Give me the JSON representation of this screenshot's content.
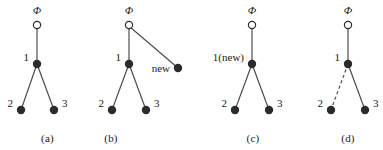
{
  "figure": {
    "background_color": "#ffffff",
    "ink_color": "#1a1a1a",
    "edge_color": "#4d4d4d",
    "filled_node_color": "#2b2b2b",
    "open_node_fill": "#ffffff",
    "root_symbol": "Φ",
    "panels": [
      {
        "id": "panel-a",
        "caption": "(a)",
        "nodes": [
          {
            "id": "root",
            "label": "Φ",
            "label_pos": "above",
            "style": "open",
            "x": 37,
            "y": 25
          },
          {
            "id": "n1",
            "label": "1",
            "label_pos": "left",
            "style": "filled",
            "x": 37,
            "y": 64
          },
          {
            "id": "n2",
            "label": "2",
            "label_pos": "left",
            "style": "filled",
            "x": 21,
            "y": 110
          },
          {
            "id": "n3",
            "label": "3",
            "label_pos": "right",
            "style": "filled",
            "x": 54,
            "y": 110
          }
        ],
        "edges": [
          {
            "from": "root",
            "to": "n1",
            "style": "solid"
          },
          {
            "from": "n1",
            "to": "n2",
            "style": "solid"
          },
          {
            "from": "n1",
            "to": "n3",
            "style": "solid"
          }
        ]
      },
      {
        "id": "panel-b",
        "caption": "(b)",
        "nodes": [
          {
            "id": "root",
            "label": "Φ",
            "label_pos": "above",
            "style": "open",
            "x": 129,
            "y": 25
          },
          {
            "id": "n1",
            "label": "1",
            "label_pos": "left",
            "style": "filled",
            "x": 129,
            "y": 64
          },
          {
            "id": "n2",
            "label": "2",
            "label_pos": "left",
            "style": "filled",
            "x": 112,
            "y": 110
          },
          {
            "id": "n3",
            "label": "3",
            "label_pos": "right",
            "style": "filled",
            "x": 146,
            "y": 110
          },
          {
            "id": "nnew",
            "label": "new",
            "label_pos": "left",
            "style": "filled",
            "x": 178,
            "y": 68
          }
        ],
        "edges": [
          {
            "from": "root",
            "to": "n1",
            "style": "solid"
          },
          {
            "from": "root",
            "to": "nnew",
            "style": "solid"
          },
          {
            "from": "n1",
            "to": "n2",
            "style": "solid"
          },
          {
            "from": "n1",
            "to": "n3",
            "style": "solid"
          }
        ]
      },
      {
        "id": "panel-c",
        "caption": "(c)",
        "nodes": [
          {
            "id": "root",
            "label": "Φ",
            "label_pos": "above",
            "style": "open",
            "x": 252,
            "y": 25
          },
          {
            "id": "n1",
            "label": "1(new)",
            "label_pos": "left",
            "style": "filled",
            "x": 252,
            "y": 64
          },
          {
            "id": "n2",
            "label": "2",
            "label_pos": "left",
            "style": "filled",
            "x": 235,
            "y": 110
          },
          {
            "id": "n3",
            "label": "3",
            "label_pos": "right",
            "style": "filled",
            "x": 269,
            "y": 110
          }
        ],
        "edges": [
          {
            "from": "root",
            "to": "n1",
            "style": "solid"
          },
          {
            "from": "n1",
            "to": "n2",
            "style": "solid"
          },
          {
            "from": "n1",
            "to": "n3",
            "style": "solid"
          }
        ]
      },
      {
        "id": "panel-d",
        "caption": "(d)",
        "nodes": [
          {
            "id": "root",
            "label": "Φ",
            "label_pos": "above",
            "style": "open",
            "x": 348,
            "y": 25
          },
          {
            "id": "n1",
            "label": "1",
            "label_pos": "left",
            "style": "filled",
            "x": 348,
            "y": 64
          },
          {
            "id": "n2",
            "label": "2",
            "label_pos": "left",
            "style": "filled",
            "x": 331,
            "y": 110
          },
          {
            "id": "n3",
            "label": "3",
            "label_pos": "right",
            "style": "filled",
            "x": 365,
            "y": 110
          }
        ],
        "edges": [
          {
            "from": "root",
            "to": "n1",
            "style": "solid"
          },
          {
            "from": "n1",
            "to": "n2",
            "style": "dashed"
          },
          {
            "from": "n1",
            "to": "n3",
            "style": "solid"
          }
        ]
      }
    ]
  }
}
